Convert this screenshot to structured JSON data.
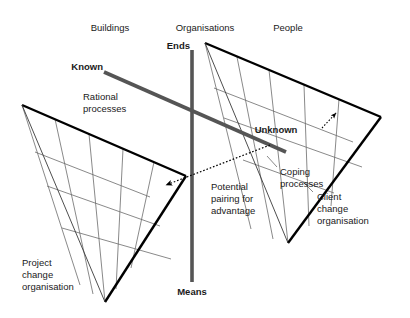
{
  "diagram": {
    "colors": {
      "outline": "#000000",
      "grid": "#6b6b6b",
      "axis": "#555555",
      "known_line": "#555555",
      "text": "#1a1a1a",
      "background": "#ffffff"
    },
    "column_headers": [
      {
        "label": "Buildings",
        "x": 110,
        "y": 28
      },
      {
        "label": "Organisations",
        "x": 205,
        "y": 28
      },
      {
        "label": "People",
        "x": 288,
        "y": 28
      }
    ],
    "axis_labels": {
      "top": "Ends",
      "bottom": "Means"
    },
    "axis_endpoints": {
      "top_x": 192,
      "top_y": 50,
      "bottom_x": 192,
      "bottom_y": 282
    },
    "known_line": {
      "label": "Known",
      "label_x": 85,
      "label_y": 68,
      "x1": 104,
      "y1": 72,
      "x2": 286,
      "y2": 152
    },
    "unknown_label": {
      "label": "Unknown",
      "x": 276,
      "y": 130
    },
    "annotations": [
      {
        "name": "rational-processes",
        "lines": [
          "Rational",
          "processes"
        ],
        "x": 83,
        "y": 97
      },
      {
        "name": "coping-processes",
        "lines": [
          "Coping",
          "processes"
        ],
        "x": 279,
        "y": 172
      },
      {
        "name": "potential-pairing",
        "lines": [
          "Potential",
          "pairing for",
          "advantage"
        ],
        "x": 210,
        "y": 186
      },
      {
        "name": "project-change-organisation",
        "lines": [
          "Project",
          "change",
          "organisation"
        ],
        "x": 22,
        "y": 262
      },
      {
        "name": "client-change-organisation",
        "lines": [
          "Client",
          "change",
          "organisation"
        ],
        "x": 316,
        "y": 196
      }
    ],
    "left_shape": {
      "name": "project-change-organisation-funnel",
      "outline": "22,105 185,176 105,302 22,105",
      "ribs": [
        "22,105 78,284",
        "53,118 92,293",
        "88,133 105,302",
        "122,148 115,289",
        "152,161 130,268"
      ],
      "bands": [
        "46,185 158,225",
        "62,227 170,258",
        "35,152 148,196"
      ]
    },
    "right_shape": {
      "name": "client-change-organisation-funnel",
      "outline": "205,43 380,117 288,243 205,43",
      "ribs": [
        "205,43 250,228",
        "236,56 272,238",
        "268,69 288,243",
        "303,84 308,225",
        "338,98 330,205"
      ],
      "bands": [
        "222,110 360,163",
        "240,152 330,188",
        "214,88 352,142"
      ]
    },
    "dotted_arrow_left": {
      "name": "potential-pairing-arrow",
      "from_x": 268,
      "from_y": 144,
      "to_x": 163,
      "to_y": 186
    },
    "dotted_arrow_right": {
      "name": "unknown-pointer-arrow",
      "from_x": 323,
      "from_y": 127,
      "to_x": 337,
      "to_y": 112
    },
    "leader_lines": [
      {
        "name": "coping-leader-1",
        "d": "M 278,168 L 268,158"
      },
      {
        "name": "coping-leader-2",
        "d": "M 300,182 L 312,192"
      }
    ]
  }
}
